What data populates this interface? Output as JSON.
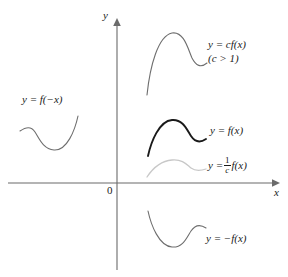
{
  "figure": {
    "axes": {
      "x_label": "x",
      "y_label": "y",
      "origin_label": "0",
      "axis_color": "#6b6b6b",
      "x_axis_y": 183,
      "y_axis_x": 117,
      "x_axis_start": 8,
      "x_axis_end": 278,
      "y_axis_top": 18,
      "y_axis_bottom": 270
    },
    "labels": {
      "c_stretch": {
        "line1_prefix": "y",
        "line1_equals": "=",
        "line1_rest": "cf(x)",
        "line2": "(c > 1)",
        "full": "y = cf(x) (c > 1)"
      },
      "reflect_y": {
        "text": "y = f(−x)"
      },
      "base": {
        "text": "y = f(x)"
      },
      "c_shrink": {
        "prefix": "y =",
        "numerator": "1",
        "denominator": "c",
        "suffix": "f(x)",
        "full": "y = (1/c) f(x)"
      },
      "reflect_x": {
        "text": "y = −f(x)"
      }
    },
    "curves": [
      {
        "name": "cf(x)",
        "color": "#6e6e6e",
        "width": 1.1,
        "description": "vertically stretched curve, highest above x-axis"
      },
      {
        "name": "f(x)",
        "color": "#1a1a1a",
        "width": 1.9,
        "description": "base function, drawn bold"
      },
      {
        "name": "(1/c)f(x)",
        "color": "#c8c8c8",
        "width": 1.3,
        "description": "vertically compressed curve, light gray, near x-axis"
      },
      {
        "name": "-f(x)",
        "color": "#6e6e6e",
        "width": 1.1,
        "description": "reflection across the x-axis, below the axis"
      },
      {
        "name": "f(-x)",
        "color": "#6e6e6e",
        "width": 1.1,
        "description": "reflection across the y-axis, left half-plane"
      }
    ]
  }
}
